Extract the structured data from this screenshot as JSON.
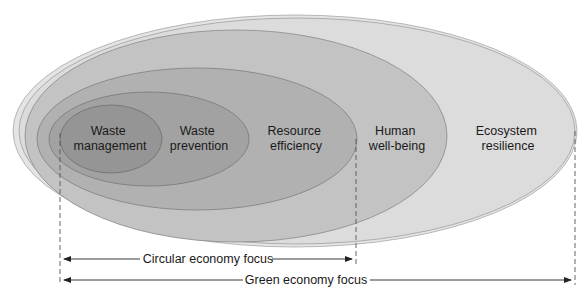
{
  "diagram": {
    "type": "nested-ellipses",
    "layers": [
      {
        "id": "ecosystem",
        "line1": "Ecosystem",
        "line2": "resilience",
        "fill": "#dcdcdc"
      },
      {
        "id": "human",
        "line1": "Human",
        "line2": "well-being",
        "fill": "#c4c4c4"
      },
      {
        "id": "resource",
        "line1": "Resource",
        "line2": "efficiency",
        "fill": "#b2b2b2"
      },
      {
        "id": "prevention",
        "line1": "Waste",
        "line2": "prevention",
        "fill": "#a3a3a3"
      },
      {
        "id": "management",
        "line1": "Waste",
        "line2": "management",
        "fill": "#959595"
      }
    ],
    "ranges": {
      "circular": "Circular economy focus",
      "green": "Green economy focus"
    }
  }
}
